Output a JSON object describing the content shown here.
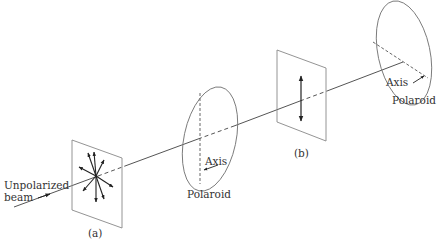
{
  "diagram": {
    "labels": {
      "source": "Unpolarized\nbeam",
      "source_line1": "Unpolarized",
      "source_line2": "beam",
      "plate_a": "(a)",
      "plate_b": "(b)",
      "polaroid1": "Polaroid",
      "polaroid1_axis": "Axis",
      "polaroid2": "Polaroid",
      "polaroid2_axis": "Axis"
    },
    "colors": {
      "line": "#555555",
      "frame": "#888888",
      "arrow": "#222222"
    }
  }
}
